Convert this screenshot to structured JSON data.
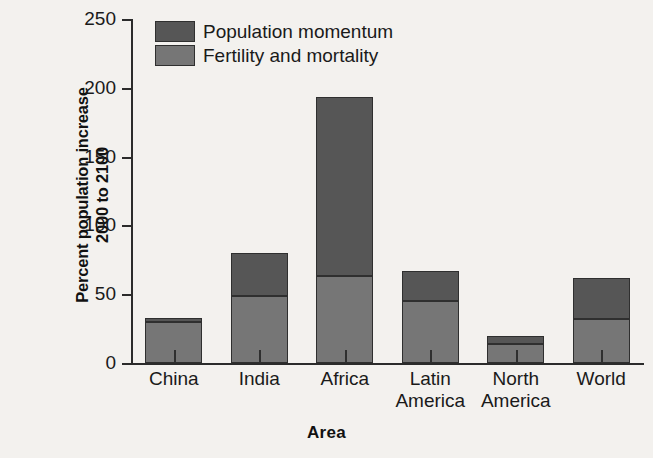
{
  "chart_data": {
    "type": "bar",
    "subtype": "stacked-bar",
    "title": "",
    "xlabel": "Area",
    "ylabel": "Percent population increase 2000 to 2100",
    "ylabel_line1": "Percent population increase",
    "ylabel_line2": "2000 to 2100",
    "categories": [
      "China",
      "India",
      "Africa",
      "Latin America",
      "North America",
      "World"
    ],
    "category_lines": [
      [
        "China",
        ""
      ],
      [
        "India",
        ""
      ],
      [
        "Africa",
        ""
      ],
      [
        "Latin",
        "America"
      ],
      [
        "North",
        "America"
      ],
      [
        "World",
        ""
      ]
    ],
    "series": [
      {
        "name": "Fertility and mortality",
        "color": "#767676",
        "values": [
          30,
          49,
          63,
          45,
          14,
          32
        ]
      },
      {
        "name": "Population momentum",
        "color": "#565656",
        "values": [
          3,
          31,
          130,
          22,
          6,
          30
        ]
      }
    ],
    "totals": [
      33,
      80,
      193,
      67,
      20,
      62
    ],
    "ylim": [
      0,
      250
    ],
    "yticks": [
      0,
      50,
      100,
      150,
      200,
      250
    ],
    "ytick_labels": [
      "0",
      "50",
      "100",
      "150",
      "200",
      "250"
    ],
    "grid": false,
    "legend_position": "upper-left-inside",
    "stack_order_bottom_to_top": [
      "Fertility and mortality",
      "Population momentum"
    ]
  },
  "legend": {
    "entries": [
      {
        "label": "Population momentum",
        "color": "#565656"
      },
      {
        "label": "Fertility and mortality",
        "color": "#767676"
      }
    ]
  },
  "colors": {
    "background": "#f3f1ee",
    "axis": "#2b2b2b",
    "momentum": "#565656",
    "fertility": "#767676",
    "bar_outline": "#2f2f2f",
    "text": "#1a1a1a"
  }
}
